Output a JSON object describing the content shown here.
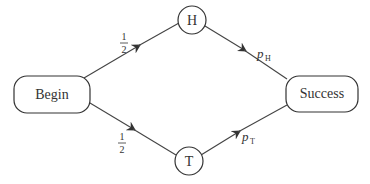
{
  "diagram": {
    "type": "probability-tree",
    "nodes": {
      "begin": {
        "label": "Begin"
      },
      "heads": {
        "label": "H"
      },
      "tails": {
        "label": "T"
      },
      "success": {
        "label": "Success"
      }
    },
    "edges": {
      "begin_to_h": {
        "numerator": "1",
        "denominator": "2"
      },
      "begin_to_t": {
        "numerator": "1",
        "denominator": "2"
      },
      "h_to_success": {
        "symbol": "p",
        "subscript": "H"
      },
      "t_to_success": {
        "symbol": "p",
        "subscript": "T"
      }
    }
  }
}
